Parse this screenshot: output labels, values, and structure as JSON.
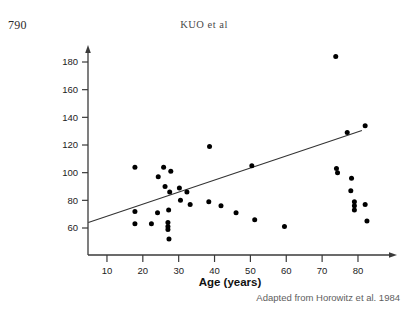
{
  "page": {
    "folio": "790",
    "running_head": "KUO et al"
  },
  "figure": {
    "credit": "Adapted from Horowitz et al. 1984"
  },
  "chart_data": {
    "type": "scatter",
    "title": "",
    "xlabel": "Age (years)",
    "ylabel": "Solid 50% emptying time",
    "xlim": [
      0,
      88
    ],
    "ylim": [
      45,
      190
    ],
    "xticks": [
      10,
      20,
      30,
      40,
      50,
      60,
      70,
      80
    ],
    "yticks": [
      60,
      80,
      100,
      120,
      140,
      160,
      180
    ],
    "grid": false,
    "legend": "none",
    "point_color": "#000000",
    "line_color": "#333333",
    "trendline": {
      "label": "linear fit",
      "x": [
        4.8,
        81.1
      ],
      "y": [
        64.0,
        130.5
      ]
    },
    "points": [
      {
        "x": 17.8,
        "y": 104
      },
      {
        "x": 17.8,
        "y": 72
      },
      {
        "x": 17.8,
        "y": 63
      },
      {
        "x": 24.3,
        "y": 97
      },
      {
        "x": 25.8,
        "y": 104
      },
      {
        "x": 26.2,
        "y": 90
      },
      {
        "x": 27.8,
        "y": 101
      },
      {
        "x": 27.5,
        "y": 86
      },
      {
        "x": 27.2,
        "y": 73
      },
      {
        "x": 27.0,
        "y": 64
      },
      {
        "x": 27.0,
        "y": 61
      },
      {
        "x": 27.0,
        "y": 59
      },
      {
        "x": 27.3,
        "y": 52
      },
      {
        "x": 24.1,
        "y": 71
      },
      {
        "x": 22.4,
        "y": 63
      },
      {
        "x": 30.2,
        "y": 89
      },
      {
        "x": 30.5,
        "y": 80
      },
      {
        "x": 32.3,
        "y": 86
      },
      {
        "x": 33.2,
        "y": 77
      },
      {
        "x": 38.6,
        "y": 119
      },
      {
        "x": 38.4,
        "y": 79
      },
      {
        "x": 41.8,
        "y": 76
      },
      {
        "x": 46.0,
        "y": 71
      },
      {
        "x": 50.4,
        "y": 105
      },
      {
        "x": 51.2,
        "y": 66
      },
      {
        "x": 59.5,
        "y": 61
      },
      {
        "x": 73.8,
        "y": 184
      },
      {
        "x": 74.0,
        "y": 103
      },
      {
        "x": 74.3,
        "y": 100
      },
      {
        "x": 77.0,
        "y": 129
      },
      {
        "x": 78.2,
        "y": 96
      },
      {
        "x": 78.0,
        "y": 87
      },
      {
        "x": 79.0,
        "y": 79
      },
      {
        "x": 79.0,
        "y": 76
      },
      {
        "x": 79.0,
        "y": 73
      },
      {
        "x": 82.0,
        "y": 134
      },
      {
        "x": 82.0,
        "y": 77
      },
      {
        "x": 82.5,
        "y": 65
      }
    ]
  }
}
